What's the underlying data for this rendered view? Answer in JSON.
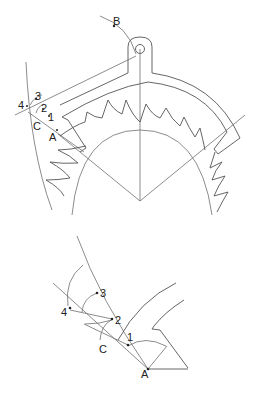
{
  "figure": {
    "type": "escapement-geometry-diagram",
    "panels": [
      {
        "name": "full-escapement-view",
        "labels": {
          "B": "B",
          "p3": "3",
          "p4": "4",
          "p2": "2",
          "p1": "1",
          "C": "C",
          "A": "A"
        }
      },
      {
        "name": "pallet-detail-view",
        "labels": {
          "p3": "3",
          "p2": "2",
          "p4": "4",
          "p1": "1",
          "C": "C",
          "A": "A"
        }
      }
    ],
    "colors": {
      "line": "#6f6f6f",
      "text": "#222222",
      "background": "#ffffff"
    }
  }
}
